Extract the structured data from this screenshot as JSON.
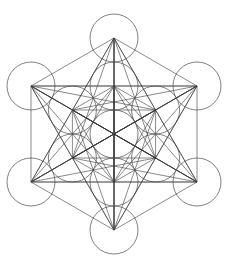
{
  "diagram": {
    "name": "metatrons-cube",
    "canvas": {
      "width": 230,
      "height": 263,
      "background": "#ffffff"
    },
    "stroke_color": "#3a3a3a",
    "center": [
      114,
      134
    ],
    "outer_radius": 96,
    "circle_radius": 24,
    "nodes": {
      "center": [
        114,
        134
      ],
      "inner": [
        [
          114,
          86
        ],
        [
          155.6,
          110
        ],
        [
          155.6,
          158
        ],
        [
          114,
          182
        ],
        [
          72.4,
          158
        ],
        [
          72.4,
          110
        ]
      ],
      "outer": [
        [
          114,
          38
        ],
        [
          197,
          86
        ],
        [
          197,
          182
        ],
        [
          114,
          230
        ],
        [
          31,
          182
        ],
        [
          31,
          86
        ]
      ]
    },
    "connect_all_nodes": true
  }
}
